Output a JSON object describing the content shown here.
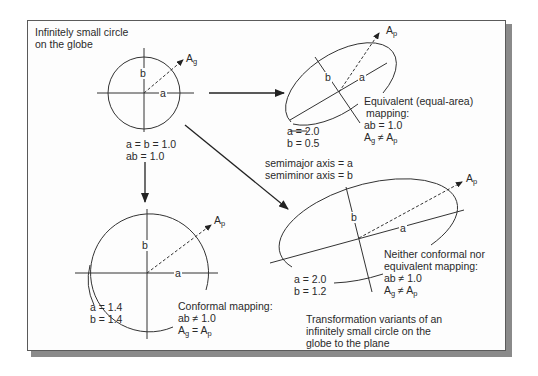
{
  "figure": {
    "caption": [
      "Transformation variants of an",
      "infinitely small circle on the",
      "globe to the plane"
    ],
    "legend": {
      "semimajor": "semimajor axis = a",
      "semiminor": "semiminor axis = b"
    }
  },
  "globe_circle": {
    "title": [
      "Infinitely small circle",
      "on the globe"
    ],
    "vector_label": "A",
    "vector_sub": "g",
    "axis_a": "a",
    "axis_b": "b",
    "values": [
      "a = b = 1.0",
      "ab = 1.0"
    ]
  },
  "equivalent": {
    "vector_label": "A",
    "vector_sub": "p",
    "axis_a": "a",
    "axis_b": "b",
    "values": [
      "a = 2.0",
      "b = 0.5"
    ],
    "description": [
      "Equivalent (equal-area)",
      "mapping:",
      "ab = 1.0"
    ],
    "relation": {
      "left": "A",
      "left_sub": "g",
      "op": "≠",
      "right": "A",
      "right_sub": "p"
    }
  },
  "conformal": {
    "vector_label": "A",
    "vector_sub": "p",
    "axis_a": "a",
    "axis_b": "b",
    "values": [
      "a = 1.4",
      "b = 1.4"
    ],
    "description": [
      "Conformal mapping:",
      "ab ≠ 1.0"
    ],
    "relation": {
      "left": "A",
      "left_sub": "g",
      "op": "=",
      "right": "A",
      "right_sub": "p"
    }
  },
  "neither": {
    "vector_label": "A",
    "vector_sub": "p",
    "axis_a": "a",
    "axis_b": "b",
    "values": [
      "a = 2.0",
      "b = 1.2"
    ],
    "description": [
      "Neither conformal nor",
      "equivalent mapping:",
      "ab ≠ 1.0"
    ],
    "relation": {
      "left": "A",
      "left_sub": "g",
      "op": "≠",
      "right": "A",
      "right_sub": "p"
    }
  },
  "colors": {
    "line": "#333333",
    "frame_border": "#5a5a5a",
    "shadow": "#8a8a8a",
    "background": "#fdfdfd"
  }
}
